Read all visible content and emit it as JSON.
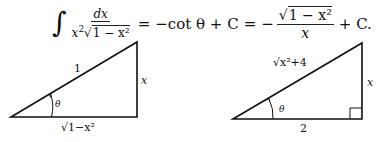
{
  "equation": {
    "integral_sign": "∫",
    "integrand_numerator": "dx",
    "integrand_denominator_x": "x",
    "integrand_denominator_pow": "2",
    "integrand_denominator_sqrt_sign": "√",
    "integrand_denominator_radicand": "1 − x²",
    "eq1": "=",
    "middle": "−cot θ + C",
    "eq2": "=",
    "minus": "−",
    "result_numerator_sqrt_sign": "√",
    "result_numerator_radicand": "1 − x²",
    "result_denominator": "x",
    "tail": "+ C."
  },
  "left_triangle": {
    "hypotenuse_label": "1",
    "opposite_label": "x",
    "adjacent_label": "√1−x²",
    "angle_label": "θ"
  },
  "right_triangle": {
    "hypotenuse_label": "√x²+4",
    "opposite_label": "x",
    "adjacent_label": "2",
    "angle_label": "θ"
  }
}
